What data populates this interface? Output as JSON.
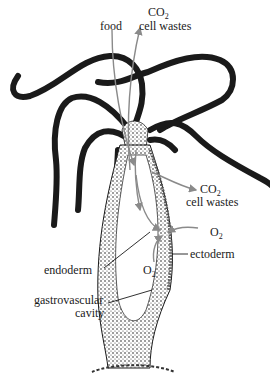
{
  "figure": {
    "labels": {
      "food": "food",
      "co2_top": "CO",
      "co2_top_sub": "2",
      "cell_wastes_top": "cell wastes",
      "co2_side": "CO",
      "co2_side_sub": "2",
      "cell_wastes_side": "cell wastes",
      "o2_outer": "O",
      "o2_outer_sub": "2",
      "ectoderm": "ectoderm",
      "endoderm": "endoderm",
      "o2_inner": "O",
      "o2_inner_sub": "2",
      "gastrovascular": "gastrovascular",
      "cavity": "cavity"
    },
    "colors": {
      "ink": "#1a1a1a",
      "arrow": "#8a8a8a",
      "background": "#ffffff"
    }
  }
}
